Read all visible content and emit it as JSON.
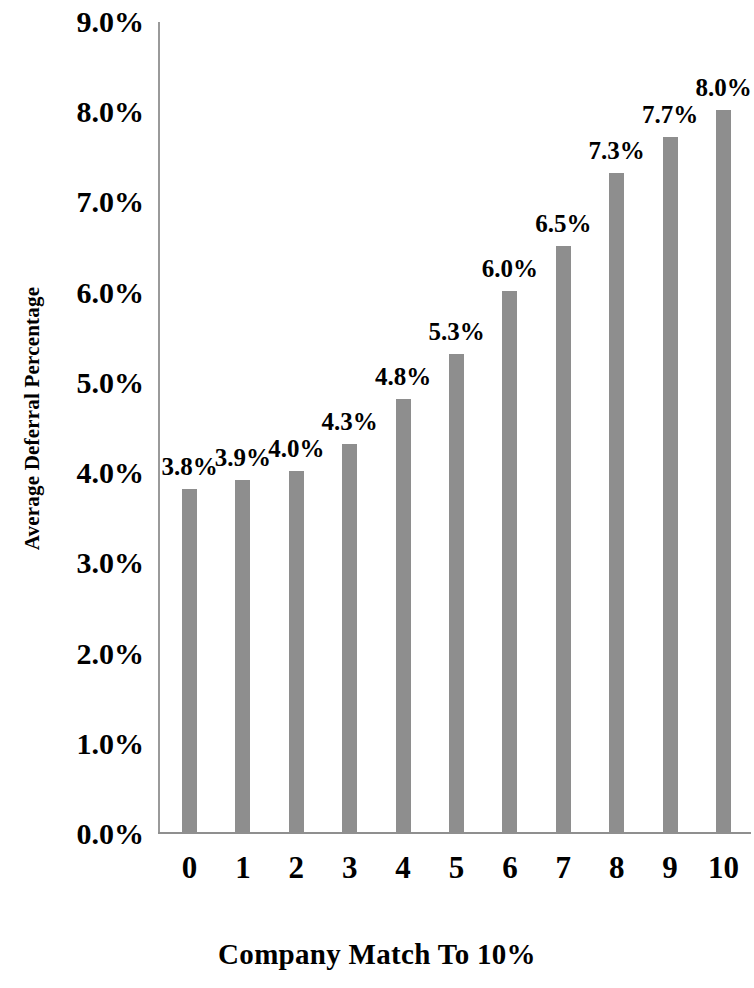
{
  "chart_data": {
    "type": "bar",
    "title": "",
    "xlabel": "Company Match To 10%",
    "ylabel": "Average Deferral Percentage",
    "categories": [
      "0",
      "1",
      "2",
      "3",
      "4",
      "5",
      "6",
      "7",
      "8",
      "9",
      "10"
    ],
    "values": [
      3.8,
      3.9,
      4.0,
      4.3,
      4.8,
      5.3,
      6.0,
      6.5,
      7.3,
      7.7,
      8.0
    ],
    "data_labels": [
      "3.8%",
      "3.9%",
      "4.0%",
      "4.3%",
      "4.8%",
      "5.3%",
      "6.0%",
      "6.5%",
      "7.3%",
      "7.7%",
      "8.0%"
    ],
    "ylim": [
      0,
      9
    ],
    "y_tick_values": [
      9.0,
      8.0,
      7.0,
      6.0,
      5.0,
      4.0,
      3.0,
      2.0,
      1.0,
      0.0
    ],
    "y_tick_labels": [
      "9.0%",
      "8.0%",
      "7.0%",
      "6.0%",
      "5.0%",
      "4.0%",
      "3.0%",
      "2.0%",
      "1.0%",
      "0.0%"
    ],
    "grid": false,
    "legend": "none",
    "bar_color": "#8e8e8e",
    "axis_color": "#8f8f8f",
    "text_color": "#000000",
    "background": "#ffffff"
  }
}
